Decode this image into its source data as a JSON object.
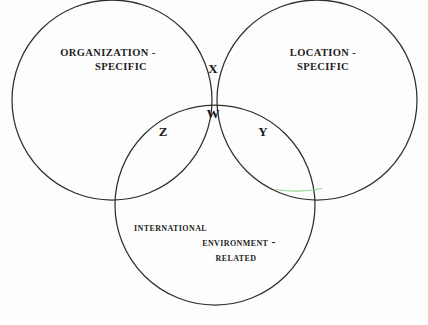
{
  "diagram": {
    "type": "venn-3-circle",
    "background_color": "#fdfdfd",
    "stroke_color": "#2f2f2f",
    "text_color": "#1d1d22",
    "circles": [
      {
        "id": "organization",
        "label_lines": [
          "ORGANIZATION -",
          "SPECIFIC"
        ],
        "cx": 112,
        "cy": 100,
        "r": 100
      },
      {
        "id": "location",
        "label_lines": [
          "LOCATION -",
          "SPECIFIC"
        ],
        "cx": 317,
        "cy": 100,
        "r": 100
      },
      {
        "id": "international",
        "label_lines": [
          "INTERNATIONAL",
          "ENVIRONMENT -",
          "RELATED"
        ],
        "cx": 215,
        "cy": 205,
        "r": 100
      }
    ],
    "labels": {
      "organization": {
        "line1": "ORGANIZATION -",
        "line2": "SPECIFIC"
      },
      "location": {
        "line1": "LOCATION -",
        "line2": "SPECIFIC"
      },
      "international": {
        "line1": "INTERNATIONAL",
        "line2": "ENVIRONMENT -",
        "line3": "RELATED"
      }
    },
    "regions": [
      {
        "id": "x",
        "letter": "X",
        "meaning": "organization-specific and location-specific only"
      },
      {
        "id": "w",
        "letter": "W",
        "meaning": "all three sets"
      },
      {
        "id": "z",
        "letter": "Z",
        "meaning": "organization-specific and international-environment-related"
      },
      {
        "id": "y",
        "letter": "Y",
        "meaning": "location-specific and international-environment-related"
      }
    ],
    "region_letters": {
      "x": "X",
      "w": "W",
      "z": "Z",
      "y": "Y"
    }
  }
}
